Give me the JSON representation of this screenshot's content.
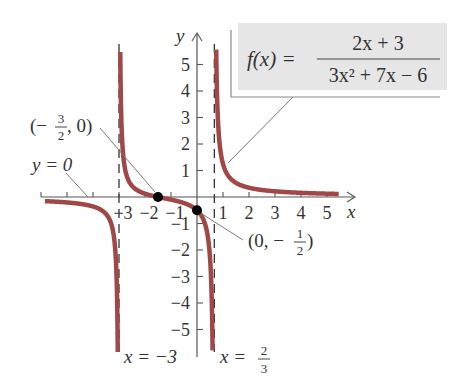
{
  "chart_data": {
    "type": "line",
    "title": "",
    "function_label": "f(x) =",
    "function_numerator": "2x + 3",
    "function_denominator": "3x² + 7x − 6",
    "xlabel": "x",
    "ylabel": "y",
    "xlim": [
      -6,
      6
    ],
    "ylim": [
      -6,
      6
    ],
    "x_ticks": [
      -6,
      -5,
      -4,
      -3,
      -2,
      -1,
      1,
      2,
      3,
      4,
      5
    ],
    "x_tick_labels": [
      "−3",
      "−2",
      "−1",
      "1",
      "2",
      "3",
      "4",
      "5"
    ],
    "x_tick_label_values": [
      -3,
      -2,
      -1,
      1,
      2,
      3,
      4,
      5
    ],
    "y_ticks": [
      -5,
      -4,
      -3,
      -2,
      -1,
      1,
      2,
      3,
      4,
      5
    ],
    "y_tick_labels": [
      "−5",
      "−4",
      "−3",
      "−2",
      "−1",
      "1",
      "2",
      "3",
      "4",
      "5"
    ],
    "grid": false,
    "curve_color": "#a04848",
    "series": [
      {
        "name": "f(x) = (2x+3)/(3x^2+7x-6)",
        "branches": [
          {
            "x": [
              -5.8,
              -5,
              -4.5,
              -4,
              -3.5,
              -3.2,
              -3.1,
              -3.05
            ],
            "y": [
              -0.19,
              -0.27,
              -0.35,
              -0.5,
              -1.0,
              -2.5,
              -4.9,
              -9.9
            ]
          },
          {
            "x": [
              -2.95,
              -2.9,
              -2.5,
              -2,
              -1.5,
              -1,
              0,
              0.4,
              0.6
            ],
            "y": [
              10.0,
              4.9,
              1.0,
              0.25,
              0,
              -0.1,
              -0.5,
              -1.2,
              -4.1
            ]
          },
          {
            "x": [
              0.72,
              0.8,
              1,
              1.5,
              2,
              3,
              4,
              5,
              5.4
            ],
            "y": [
              5.6,
              2.9,
              1.25,
              0.48,
              0.29,
              0.15,
              0.09,
              0.06,
              0.05
            ]
          }
        ]
      }
    ],
    "asymptotes": [
      {
        "type": "vertical",
        "value": -3,
        "label": "x = −3"
      },
      {
        "type": "vertical",
        "value": 0.6667,
        "label_prefix": "x =",
        "label_num": "2",
        "label_den": "3"
      },
      {
        "type": "horizontal",
        "value": 0,
        "label": "y = 0"
      }
    ],
    "points": [
      {
        "x": -1.5,
        "y": 0,
        "label_open": "(−",
        "label_num": "3",
        "label_den": "2",
        "label_close": ", 0)"
      },
      {
        "x": 0,
        "y": -0.5,
        "label_open": "(0, −",
        "label_num": "1",
        "label_den": "2",
        "label_close": ")"
      }
    ]
  }
}
